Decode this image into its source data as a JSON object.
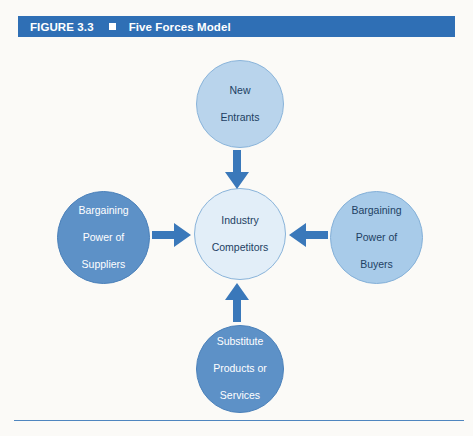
{
  "figure": {
    "number": "FIGURE 3.3",
    "bullet": "square-bullet",
    "title": "Five Forces Model"
  },
  "diagram": {
    "type": "five-forces",
    "nodes": [
      {
        "id": "new-entrants",
        "label": "New\nEntrants",
        "line1": "New",
        "line2": "Entrants",
        "line3": "",
        "position": "top",
        "fill": "#b9d4ec",
        "text_color": "#1d3f63"
      },
      {
        "id": "suppliers",
        "label": "Bargaining\nPower of\nSuppliers",
        "line1": "Bargaining",
        "line2": "Power of",
        "line3": "Suppliers",
        "position": "left",
        "fill": "#5d91c7",
        "text_color": "#ffffff"
      },
      {
        "id": "industry",
        "label": "Industry\nCompetitors",
        "line1": "Industry",
        "line2": "Competitors",
        "line3": "",
        "position": "center",
        "fill": "#e2eef8",
        "text_color": "#1d3f63"
      },
      {
        "id": "buyers",
        "label": "Bargaining\nPower of\nBuyers",
        "line1": "Bargaining",
        "line2": "Power of",
        "line3": "Buyers",
        "position": "right",
        "fill": "#a8cbe9",
        "text_color": "#1d3f63"
      },
      {
        "id": "substitutes",
        "label": "Substitute\nProducts or\nServices",
        "line1": "Substitute",
        "line2": "Products or",
        "line3": "Services",
        "position": "bottom",
        "fill": "#5d91c7",
        "text_color": "#ffffff"
      }
    ],
    "arrows": [
      {
        "id": "arrow-top",
        "from": "new-entrants",
        "to": "industry",
        "direction": "down",
        "color": "#3a78ba"
      },
      {
        "id": "arrow-left",
        "from": "suppliers",
        "to": "industry",
        "direction": "right",
        "color": "#3a78ba"
      },
      {
        "id": "arrow-right",
        "from": "buyers",
        "to": "industry",
        "direction": "left",
        "color": "#3a78ba"
      },
      {
        "id": "arrow-bottom",
        "from": "substitutes",
        "to": "industry",
        "direction": "up",
        "color": "#3a78ba"
      }
    ]
  },
  "colors": {
    "header_bar": "#2f6fb5",
    "header_text": "#ffffff",
    "arrow": "#3a78ba",
    "rule": "#4f86bf",
    "page_background": "#fbfaf7"
  }
}
